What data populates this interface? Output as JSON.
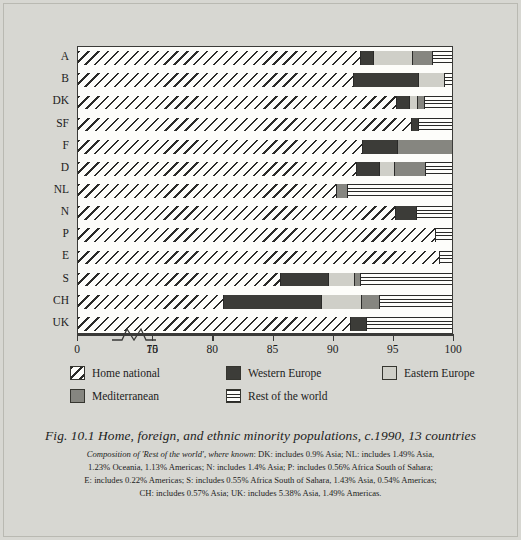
{
  "chart_data": {
    "type": "bar",
    "orientation": "horizontal",
    "title": "Fig. 10.1  Home, foreign, and ethnic minority populations, c.1990, 13 countries",
    "xlabel": "",
    "ylabel": "",
    "xlim": [
      0,
      100
    ],
    "axis_break": {
      "after": 10,
      "resume": 75,
      "label_left": "10",
      "label_right": "75"
    },
    "xticks": [
      0,
      10,
      75,
      80,
      85,
      90,
      95,
      100
    ],
    "xticklabels": [
      "0",
      "10",
      "75",
      "80",
      "85",
      "90",
      "95",
      "100"
    ],
    "grid": false,
    "legend_position": "below-plot",
    "categories": [
      "A",
      "B",
      "DK",
      "SF",
      "F",
      "D",
      "NL",
      "N",
      "P",
      "E",
      "S",
      "CH",
      "UK"
    ],
    "series": [
      {
        "name": "Home national",
        "key": "home",
        "fill": "diagonal-hatch",
        "values": [
          92.6,
          91.9,
          95.6,
          96.7,
          92.6,
          92.2,
          90.4,
          95.4,
          98.7,
          99.0,
          85.8,
          81.0,
          91.6
        ]
      },
      {
        "name": "Western Europe",
        "key": "west",
        "fill": "dark-solid",
        "values": [
          1.0,
          5.4,
          1.0,
          0.5,
          2.9,
          1.9,
          0.0,
          1.7,
          0.0,
          0.0,
          4.0,
          8.2,
          1.3
        ]
      },
      {
        "name": "Eastern Europe",
        "key": "east",
        "fill": "light-gray",
        "values": [
          3.2,
          2.1,
          0.6,
          0.0,
          0.0,
          1.2,
          0.0,
          0.0,
          0.0,
          0.0,
          2.1,
          3.3,
          0.0
        ]
      },
      {
        "name": "Mediterranean",
        "key": "med",
        "fill": "medium-gray",
        "values": [
          1.6,
          0.0,
          0.5,
          0.0,
          4.5,
          2.5,
          0.9,
          0.0,
          0.0,
          0.0,
          0.4,
          1.4,
          0.0
        ]
      },
      {
        "name": "Rest of the world",
        "key": "rest",
        "fill": "horizontal-lines",
        "values": [
          1.6,
          0.6,
          2.3,
          2.8,
          0.0,
          2.2,
          8.7,
          2.9,
          1.3,
          1.0,
          7.7,
          6.1,
          7.1
        ]
      }
    ],
    "note_lines": [
      "Composition of 'Rest of the world', where known: DK: includes 0.9% Asia; NL: includes 1.49% Asia,",
      "1.23% Oceania, 1.13% Americas; N: includes 1.4% Asia; P: includes 0.56% Africa South of Sahara;",
      "E: includes 0.22% Americas; S: includes 0.55% Africa South of Sahara, 1.43% Asia, 0.54% Americas;",
      "CH: includes 0.57% Asia; UK: includes 5.38% Asia, 1.49% Americas."
    ],
    "colors": {
      "page_background": "#d7d7d2",
      "plot_background": "#fdfdfa",
      "axis": "#3a3a38",
      "western_europe": "#3c3c38",
      "eastern_europe": "#cfcfc8",
      "mediterranean": "#868680",
      "hatch": "#2a2a28"
    }
  },
  "legend": {
    "items": [
      {
        "label": "Home national",
        "pattern": "diagonal-hatch"
      },
      {
        "label": "Western Europe",
        "pattern": "dark-solid"
      },
      {
        "label": "Eastern Europe",
        "pattern": "light-gray"
      },
      {
        "label": "Mediterranean",
        "pattern": "medium-gray"
      },
      {
        "label": "Rest of the world",
        "pattern": "horizontal-lines"
      }
    ]
  },
  "caption": {
    "title": "Fig. 10.1  Home, foreign, and ethnic minority populations, c.1990, 13 countries",
    "note_italic_lead": "Composition of 'Rest of the world', where known",
    "note_rest_line1": ": DK: includes 0.9% Asia; NL: includes 1.49% Asia,",
    "note_line2": "1.23% Oceania, 1.13% Americas; N: includes 1.4% Asia; P: includes 0.56% Africa South of Sahara;",
    "note_line3": "E: includes 0.22% Americas; S: includes 0.55% Africa South of Sahara, 1.43% Asia, 0.54% Americas;",
    "note_line4": "CH: includes 0.57% Asia; UK: includes 5.38% Asia, 1.49% Americas."
  }
}
